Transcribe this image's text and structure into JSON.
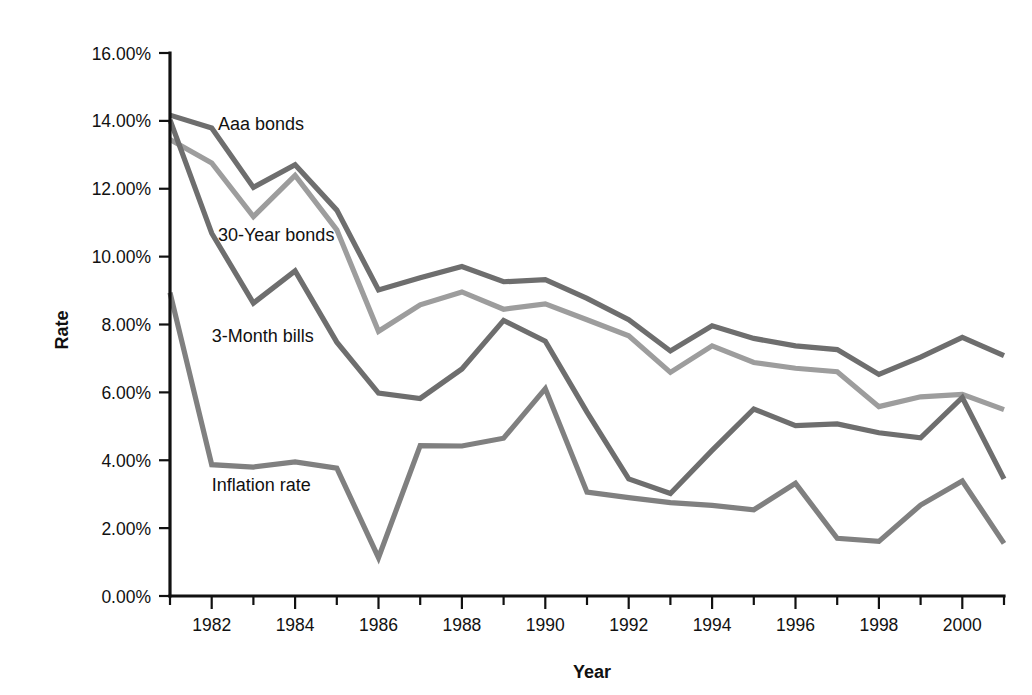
{
  "chart_data": {
    "type": "line",
    "title": "",
    "xlabel": "Year",
    "ylabel": "Rate",
    "xlim": [
      1981,
      2001
    ],
    "ylim": [
      0,
      16
    ],
    "ytick_step": 2,
    "ylabel_format": "percent-2dp",
    "grid": false,
    "legend": "inline-labels",
    "axis_color": "#111111",
    "background": "#ffffff",
    "x": [
      1981,
      1982,
      1983,
      1984,
      1985,
      1986,
      1987,
      1988,
      1989,
      1990,
      1991,
      1992,
      1993,
      1994,
      1995,
      1996,
      1997,
      1998,
      1999,
      2000,
      2001
    ],
    "xticks_major": [
      1982,
      1984,
      1986,
      1988,
      1990,
      1992,
      1994,
      1996,
      1998,
      2000
    ],
    "xtick_labels": [
      "1982",
      "1984",
      "1986",
      "1988",
      "1990",
      "1992",
      "1994",
      "1996",
      "1998",
      "2000"
    ],
    "yticks": [
      0,
      2,
      4,
      6,
      8,
      10,
      12,
      14,
      16
    ],
    "ytick_labels": [
      "0.00%",
      "2.00%",
      "4.00%",
      "6.00%",
      "8.00%",
      "10.00%",
      "12.00%",
      "14.00%",
      "16.00%"
    ],
    "series": [
      {
        "name": "Aaa bonds",
        "color": "#6e6e6e",
        "width": 5.2,
        "label_x": 1982.15,
        "label_y": 13.72,
        "values": [
          14.17,
          13.79,
          12.04,
          12.71,
          11.37,
          9.02,
          9.38,
          9.71,
          9.26,
          9.32,
          8.77,
          8.14,
          7.22,
          7.96,
          7.59,
          7.37,
          7.26,
          6.53,
          7.04,
          7.62,
          7.08
        ]
      },
      {
        "name": "30-Year bonds",
        "color": "#9d9d9d",
        "width": 5.2,
        "label_x": 1982.15,
        "label_y": 10.45,
        "values": [
          13.45,
          12.76,
          11.18,
          12.39,
          10.79,
          7.8,
          8.58,
          8.96,
          8.45,
          8.61,
          8.14,
          7.67,
          6.59,
          7.37,
          6.88,
          6.71,
          6.61,
          5.58,
          5.87,
          5.94,
          5.49
        ]
      },
      {
        "name": "3-Month bills",
        "color": "#6e6e6e",
        "width": 5.2,
        "label_x": 1982.0,
        "label_y": 7.48,
        "values": [
          14.03,
          10.69,
          8.63,
          9.58,
          7.48,
          5.98,
          5.82,
          6.69,
          8.12,
          7.51,
          5.42,
          3.45,
          3.02,
          4.29,
          5.51,
          5.02,
          5.07,
          4.81,
          4.66,
          5.85,
          3.45
        ]
      },
      {
        "name": "Inflation rate",
        "color": "#808080",
        "width": 5.2,
        "label_x": 1982.0,
        "label_y": 3.08,
        "values": [
          8.94,
          3.87,
          3.8,
          3.95,
          3.77,
          1.13,
          4.43,
          4.42,
          4.65,
          6.11,
          3.06,
          2.9,
          2.75,
          2.67,
          2.54,
          3.32,
          1.7,
          1.61,
          2.68,
          3.39,
          1.55
        ]
      }
    ]
  },
  "axis": {
    "y_title": "Rate",
    "x_title": "Year"
  }
}
